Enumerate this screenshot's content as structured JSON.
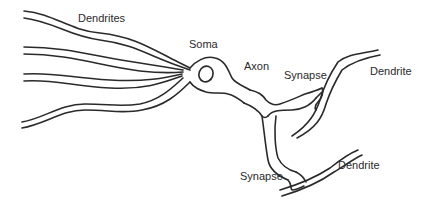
{
  "diagram": {
    "labels": {
      "dendrites": "Dendrites",
      "soma": "Soma",
      "axon": "Axon",
      "synapse_upper": "Synapse",
      "dendrite_upper": "Dendrite",
      "synapse_lower": "Synapse",
      "dendrite_lower": "Dendrite"
    },
    "colors": {
      "stroke": "#2a2a2a",
      "background": "#ffffff",
      "text": "#2a2a2a"
    }
  }
}
